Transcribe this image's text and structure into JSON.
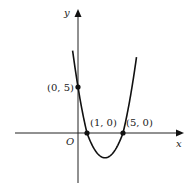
{
  "chart_data": {
    "type": "line",
    "title": "",
    "equation": "y = (x - 1)(x - 5)",
    "xlabel": "x",
    "ylabel": "y",
    "origin_label": "O",
    "xlim": [
      -7,
      11.5
    ],
    "ylim": [
      -5.5,
      13.5
    ],
    "grid": false,
    "series": [
      {
        "name": "parabola",
        "coefficients": {
          "a": 1,
          "b": -6,
          "c": 5
        },
        "x_range": [
          -0.6,
          6.5
        ],
        "color": "#111111"
      }
    ],
    "points": [
      {
        "x": 0,
        "y": 5,
        "label": "(0, 5)",
        "label_side": "left"
      },
      {
        "x": 1,
        "y": 0,
        "label": "(1, 0)",
        "label_side": "above-right"
      },
      {
        "x": 5,
        "y": 0,
        "label": "(5, 0)",
        "label_side": "above-right"
      }
    ],
    "vertex": {
      "x": 3,
      "y": -4
    }
  }
}
